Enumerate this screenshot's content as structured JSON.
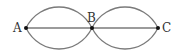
{
  "diagram": {
    "type": "geometry",
    "stroke_color": "#7a7a7a",
    "point_color": "#111111",
    "points": [
      {
        "id": "A",
        "label": "A",
        "x": 26,
        "y": 28
      },
      {
        "id": "B",
        "label": "B",
        "x": 92,
        "y": 28
      },
      {
        "id": "C",
        "label": "C",
        "x": 158,
        "y": 28
      }
    ],
    "segments": [
      {
        "from": "A",
        "to": "C",
        "style": "straight"
      }
    ],
    "arcs": [
      {
        "from": "A",
        "to": "B",
        "side": "upper"
      },
      {
        "from": "A",
        "to": "B",
        "side": "lower"
      },
      {
        "from": "B",
        "to": "C",
        "side": "upper"
      },
      {
        "from": "B",
        "to": "C",
        "side": "lower"
      }
    ]
  }
}
